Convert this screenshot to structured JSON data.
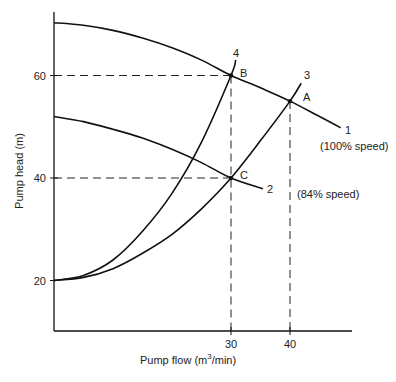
{
  "chart_data": {
    "type": "line",
    "title": "",
    "xlabel": "Pump flow (m³/min)",
    "xlabel_parts": {
      "base": "Pump flow (m",
      "sup": "3",
      "tail": "/min)"
    },
    "ylabel": "Pump head (m)",
    "xlim": [
      0,
      50
    ],
    "ylim": [
      8,
      72
    ],
    "grid": false,
    "x_ticks": [
      30,
      40
    ],
    "x_tick_labels": [
      "30",
      "40"
    ],
    "y_ticks": [
      20,
      40,
      60
    ],
    "y_tick_labels": [
      "20",
      "40",
      "60"
    ],
    "series": [
      {
        "name": "1",
        "annotation": "(100% speed)",
        "kind": "pump curve",
        "x": [
          0,
          5,
          10,
          15,
          20,
          25,
          30,
          35,
          40,
          45,
          48.6
        ],
        "y": [
          70.3,
          69.8,
          68.8,
          67.3,
          65.4,
          63.0,
          60.0,
          57.6,
          55.0,
          52.0,
          49.8
        ]
      },
      {
        "name": "2",
        "annotation": "(84% speed)",
        "kind": "pump curve",
        "x": [
          0,
          5,
          10,
          15,
          20,
          25,
          30,
          35.4
        ],
        "y": [
          52.0,
          51.0,
          49.5,
          47.8,
          45.6,
          43.0,
          40.0,
          37.9
        ]
      },
      {
        "name": "3",
        "kind": "system curve",
        "x": [
          0,
          5,
          10,
          15,
          20,
          25,
          30,
          35,
          40,
          41.9
        ],
        "y": [
          20.0,
          20.6,
          22.3,
          25.3,
          29.0,
          34.0,
          40.0,
          47.3,
          55.0,
          58.5
        ]
      },
      {
        "name": "4",
        "kind": "system curve",
        "x": [
          0,
          5,
          10,
          15,
          20,
          25,
          30,
          30.8
        ],
        "y": [
          20.0,
          21.0,
          24.0,
          29.6,
          37.0,
          47.0,
          60.0,
          63.0
        ]
      }
    ],
    "points": [
      {
        "label": "A",
        "x": 40,
        "y": 55
      },
      {
        "label": "B",
        "x": 30,
        "y": 60
      },
      {
        "label": "C",
        "x": 30,
        "y": 40
      }
    ],
    "reference_lines": [
      {
        "orientation": "horizontal",
        "y": 60,
        "x_to": 30,
        "style": "dashed"
      },
      {
        "orientation": "horizontal",
        "y": 40,
        "x_to": 30,
        "style": "dashed"
      },
      {
        "orientation": "vertical",
        "x": 30,
        "y_to": 60,
        "style": "dashed"
      },
      {
        "orientation": "vertical",
        "x": 40,
        "y_to": 55,
        "style": "dashed"
      }
    ],
    "annotations": [
      "1",
      "2",
      "3",
      "4",
      "A",
      "B",
      "C",
      "(100% speed)",
      "(84% speed)"
    ]
  }
}
